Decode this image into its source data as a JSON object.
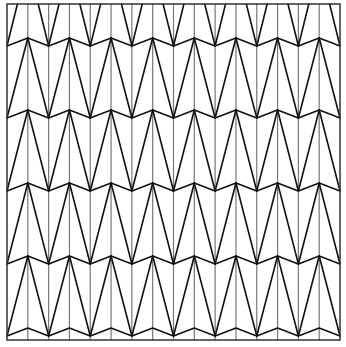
{
  "canvas": {
    "width": 346,
    "height": 347,
    "background": "#ffffff"
  },
  "pattern": {
    "name": "zigzag-triangle-tessellation",
    "frame": {
      "x0": 7,
      "y0": 4,
      "x1": 340,
      "y1": 340,
      "color": "#333333",
      "stroke_width": 1.5
    },
    "columns": 16,
    "vertical_line_color": "#777777",
    "vertical_stroke_width": 1.2,
    "diagonal_color": "#111111",
    "diagonal_stroke_width": 1.6,
    "zigzag_rows": [
      42,
      114,
      187,
      260,
      332
    ],
    "zigzag_amplitude": 4,
    "peak_parity": "odd"
  }
}
